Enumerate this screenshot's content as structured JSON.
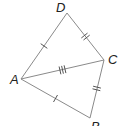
{
  "diagram": {
    "type": "quadrilateral-with-diagonal",
    "vertices": {
      "A": {
        "label": "A",
        "x": 21,
        "y": 79
      },
      "B": {
        "label": "B",
        "x": 90,
        "y": 118
      },
      "C": {
        "label": "C",
        "x": 104,
        "y": 60
      },
      "D": {
        "label": "D",
        "x": 67,
        "y": 13
      }
    },
    "edges": [
      {
        "from": "A",
        "to": "D",
        "ticks": 1
      },
      {
        "from": "D",
        "to": "C",
        "ticks": 2
      },
      {
        "from": "A",
        "to": "C",
        "ticks": 3
      },
      {
        "from": "C",
        "to": "B",
        "ticks": 2
      },
      {
        "from": "A",
        "to": "B",
        "ticks": 1
      }
    ],
    "colors": {
      "edge": "#8a8a8a",
      "tick": "#555555",
      "label": "#222222"
    }
  }
}
